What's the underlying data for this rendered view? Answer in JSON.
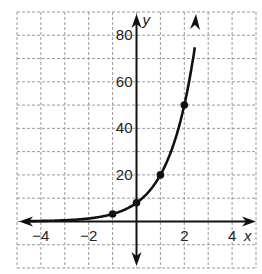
{
  "chart_data": {
    "type": "line",
    "title": "",
    "xlabel": "x",
    "ylabel": "y",
    "xlim": [
      -5,
      5
    ],
    "ylim": [
      -20,
      90
    ],
    "grid": true,
    "grid_style": "dashed",
    "x_grid_step": 1,
    "y_grid_step": 10,
    "x_ticks": [
      -4,
      -2,
      2,
      4
    ],
    "x_tick_labels": [
      "−4",
      "−2",
      "2",
      "4"
    ],
    "y_ticks": [
      20,
      40,
      60,
      80
    ],
    "y_tick_labels": [
      "20",
      "40",
      "60",
      "80"
    ],
    "function": "y = 8(2.5)^x",
    "series": [
      {
        "name": "exponential curve",
        "color": "#111111",
        "marked_points": [
          {
            "x": -1,
            "y": 3.2
          },
          {
            "x": 0,
            "y": 8
          },
          {
            "x": 1,
            "y": 20
          },
          {
            "x": 2,
            "y": 50
          }
        ],
        "arrows": [
          "left",
          "up"
        ]
      }
    ],
    "legend": null
  },
  "colors": {
    "curve": "#111111",
    "axis": "#111111",
    "grid": "#9a9a9a",
    "background": "#ffffff"
  }
}
